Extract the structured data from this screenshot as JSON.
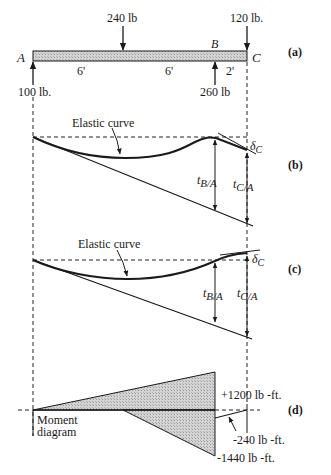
{
  "beam": {
    "end_left_label": "A",
    "end_right_label": "C",
    "support_label": "B",
    "loads": {
      "mid_load": "240 lb",
      "end_load": "120 lb.",
      "reaction_A": "100 lb.",
      "reaction_B": "260 lb"
    },
    "spans": [
      "6'",
      "6'",
      "2'"
    ]
  },
  "panels": {
    "a": "(a)",
    "b": "(b)",
    "c": "(c)",
    "d": "(d)"
  },
  "deflection_b": {
    "curve_label": "Elastic curve",
    "tBA_main": "t",
    "tBA_sub": "B/A",
    "tCA_main": "t",
    "tCA_sub": "C/A",
    "delta_main": "δ",
    "delta_sub": "C"
  },
  "deflection_c": {
    "curve_label": "Elastic curve",
    "tBA_main": "t",
    "tBA_sub": "B/A",
    "tCA_main": "t",
    "tCA_sub": "C/A",
    "delta_main": "δ",
    "delta_sub": "C"
  },
  "moment": {
    "title_line1": "Moment",
    "title_line2": "diagram",
    "pos_label": "+1200 lb -ft.",
    "neg_small_label": "-240 lb -ft.",
    "neg_large_label": "-1440 lb -ft."
  },
  "colors": {
    "hatch_fill": "#c9c9c9",
    "ink": "#1a1a1a"
  }
}
